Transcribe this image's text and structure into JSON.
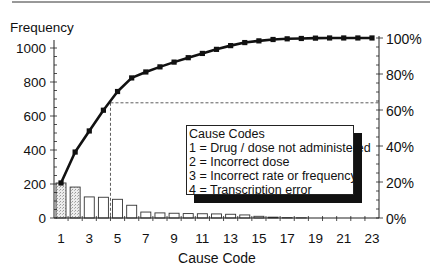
{
  "chart_data": {
    "type": "bar",
    "subtype": "pareto (bar + cumulative line)",
    "title": "",
    "xlabel": "Cause Code",
    "ylabel": "Frequency",
    "y2label": "",
    "categories": [
      1,
      2,
      3,
      4,
      5,
      6,
      7,
      8,
      9,
      10,
      11,
      12,
      13,
      14,
      15,
      16,
      17,
      18,
      19,
      20,
      21,
      22,
      23
    ],
    "x_tick_labels": [
      "1",
      "3",
      "5",
      "7",
      "9",
      "11",
      "13",
      "15",
      "17",
      "19",
      "21",
      "23"
    ],
    "y_ticks": [
      0,
      200,
      400,
      600,
      800,
      1000
    ],
    "y2_ticks": [
      "0%",
      "20%",
      "40%",
      "60%",
      "80%",
      "100%"
    ],
    "ylim": [
      0,
      1000
    ],
    "y2lim": [
      0,
      100
    ],
    "series": [
      {
        "name": "Frequency",
        "type": "bar",
        "values": [
          206,
          182,
          124,
          122,
          110,
          75,
          35,
          30,
          28,
          26,
          25,
          24,
          22,
          18,
          10,
          5,
          2,
          1,
          0,
          0,
          0,
          0,
          0
        ]
      },
      {
        "name": "Cumulative frequency",
        "type": "line",
        "values": [
          206,
          388,
          512,
          634,
          744,
          824,
          859,
          889,
          917,
          943,
          968,
          992,
          1014,
          1032,
          1042,
          1050,
          1054,
          1056,
          1058,
          1059,
          1059,
          1059,
          1059
        ]
      }
    ],
    "annotations": [
      {
        "type": "reference-line",
        "description": "dashed lines at cause code ~4.5 marking ~64% cumulative",
        "x": 4.5,
        "y_pct": 64
      }
    ],
    "grid": false,
    "legend_position": "inside center-right"
  },
  "axes": {
    "ylabel": "Frequency",
    "xlabel": "Cause Code",
    "y_ticks": [
      "0",
      "200",
      "400",
      "600",
      "800",
      "1000"
    ],
    "y2_ticks": [
      "0%",
      "20%",
      "40%",
      "60%",
      "80%",
      "100%"
    ],
    "x_ticks": [
      "1",
      "3",
      "5",
      "7",
      "9",
      "11",
      "13",
      "15",
      "17",
      "19",
      "21",
      "23"
    ]
  },
  "legend": {
    "title": "Cause Codes",
    "items": [
      "1 = Drug / dose not administered",
      "2 = Incorrect dose",
      "3 = Incorrect rate or frequency",
      "4 = Transcription error"
    ]
  },
  "colors": {
    "line": "#111111",
    "bar_fill_stippled": "#d8d8d8",
    "bar_fill": "#ffffff",
    "axis": "#222222"
  }
}
